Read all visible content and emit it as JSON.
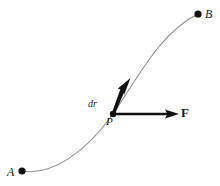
{
  "figure": {
    "background_color": "#ffffff",
    "curve_color": "#7a7a7a",
    "vector_color": "#111111",
    "point_color": "#111111",
    "labels": {
      "start_point": "A",
      "end_point": "B",
      "tangent_point": "P",
      "displacement_vector": "dr",
      "force_vector": "F"
    },
    "points": [
      {
        "name": "A",
        "x": 22,
        "y": 171,
        "radius": 3.6
      },
      {
        "name": "B",
        "x": 198,
        "y": 14,
        "radius": 3.6
      },
      {
        "name": "P",
        "x": 113,
        "y": 114,
        "radius": 3.2
      }
    ],
    "path": {
      "kind": "curve",
      "from": "A",
      "to": "B",
      "d": "M 22 171 C 52 176 86 152 113 114 C 136 81 160 32 198 14"
    },
    "vectors": [
      {
        "name": "dr",
        "label": "dr",
        "tail_x": 113,
        "tail_y": 114,
        "tip_x": 130,
        "tip_y": 79,
        "style": "tapered-tangent"
      },
      {
        "name": "F",
        "label": "F",
        "tail_x": 113,
        "tail_y": 114,
        "tip_x": 179,
        "tip_y": 114,
        "style": "straight-horizontal"
      }
    ]
  }
}
